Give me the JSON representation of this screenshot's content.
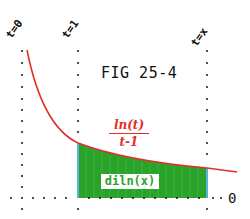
{
  "figure": {
    "title": "FIG 25-4",
    "vertical_lines": [
      {
        "label": "t=0",
        "x": 22
      },
      {
        "label": "t=1",
        "x": 78
      },
      {
        "label": "t=x",
        "x": 207
      }
    ],
    "curve_label": {
      "numerator": "ln(t)",
      "denominator": "t-1"
    },
    "area_label": "diln(x)",
    "baseline_label": "0",
    "colors": {
      "curve": "#e0302a",
      "area_fill": "#2aa32a",
      "area_edge": "#5ab0e0",
      "dots": "#111111",
      "text": "#111111"
    }
  }
}
